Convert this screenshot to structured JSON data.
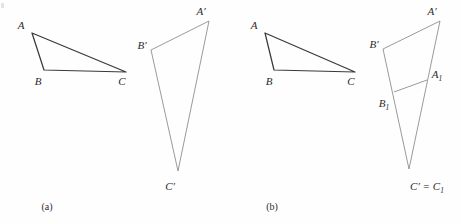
{
  "figure": {
    "background_color": "#fefefe",
    "ink_color_primary": "#2b2b2b",
    "ink_color_secondary": "#8a8a8a",
    "panels": [
      {
        "id": "a",
        "caption": "(a)",
        "caption_pos": [
          47,
          207
        ],
        "shapes": [
          {
            "name": "triangle-abc",
            "stroke": "#3a3a3a",
            "stroke_width": 1.25,
            "vertices": [
              {
                "label": "A",
                "point": [
                  32,
                  33
                ],
                "label_pos": [
                  21,
                  26
                ],
                "anchor": "middle"
              },
              {
                "label": "B",
                "point": [
                  44,
                  70
                ],
                "label_pos": [
                  38,
                  83
                ],
                "anchor": "middle"
              },
              {
                "label": "C",
                "point": [
                  126,
                  72
                ],
                "label_pos": [
                  122,
                  83
                ],
                "anchor": "middle"
              }
            ]
          },
          {
            "name": "triangle-a-prime-b-prime-c-prime",
            "stroke": "#8f8f8f",
            "stroke_width": 0.9,
            "vertices": [
              {
                "label": "A",
                "prime": "′",
                "point": [
                  209,
                  21
                ],
                "label_pos": [
                  201,
                  12
                ],
                "anchor": "middle"
              },
              {
                "label": "B",
                "prime": "′",
                "point": [
                  151,
                  50
                ],
                "label_pos": [
                  142,
                  46
                ],
                "anchor": "middle"
              },
              {
                "label": "C",
                "prime": "′",
                "point": [
                  178,
                  171
                ],
                "label_pos": [
                  170,
                  187
                ],
                "anchor": "middle"
              }
            ]
          }
        ]
      },
      {
        "id": "b",
        "caption": "(b)",
        "caption_pos": [
          272,
          207
        ],
        "shapes": [
          {
            "name": "triangle-abc",
            "stroke": "#3a3a3a",
            "stroke_width": 1.25,
            "vertices": [
              {
                "label": "A",
                "point": [
                  265,
                  33
                ],
                "label_pos": [
                  254,
                  26
                ],
                "anchor": "middle"
              },
              {
                "label": "B",
                "point": [
                  274,
                  70
                ],
                "label_pos": [
                  269,
                  83
                ],
                "anchor": "middle"
              },
              {
                "label": "C",
                "point": [
                  355,
                  72
                ],
                "label_pos": [
                  351,
                  83
                ],
                "anchor": "middle"
              }
            ]
          },
          {
            "name": "triangle-a-prime-b-prime-c-prime",
            "stroke": "#8f8f8f",
            "stroke_width": 0.9,
            "vertices": [
              {
                "label": "A",
                "prime": "′",
                "point": [
                  440,
                  21
                ],
                "label_pos": [
                  432,
                  12
                ],
                "anchor": "middle"
              },
              {
                "label": "B",
                "prime": "′",
                "point": [
                  383,
                  49
                ],
                "label_pos": [
                  374,
                  45
                ],
                "anchor": "middle"
              },
              {
                "label": "C",
                "prime": "′",
                "point": [
                  409,
                  169
                ],
                "label_pos": [
                  427,
                  187
                ],
                "anchor": "middle"
              }
            ]
          },
          {
            "name": "segment-b1-a1",
            "stroke": "#8f8f8f",
            "stroke_width": 0.9,
            "vertices": [
              {
                "label": "A",
                "sub": "1",
                "point": [
                  427,
                  80
                ],
                "label_pos": [
                  437,
                  75
                ],
                "anchor": "middle"
              },
              {
                "label": "B",
                "sub": "1",
                "point": [
                  394,
                  92
                ],
                "label_pos": [
                  384,
                  104
                ],
                "anchor": "middle"
              }
            ]
          }
        ],
        "apex_label": {
          "text_parts": [
            "C",
            "′",
            " = ",
            "C",
            "1"
          ],
          "display": "C′ = C₁"
        }
      }
    ]
  },
  "labels": {
    "A": "A",
    "B": "B",
    "C": "C",
    "prime": "′",
    "sub1": "1",
    "equals": " = ",
    "caption_a": "(a)",
    "caption_b": "(b)"
  }
}
